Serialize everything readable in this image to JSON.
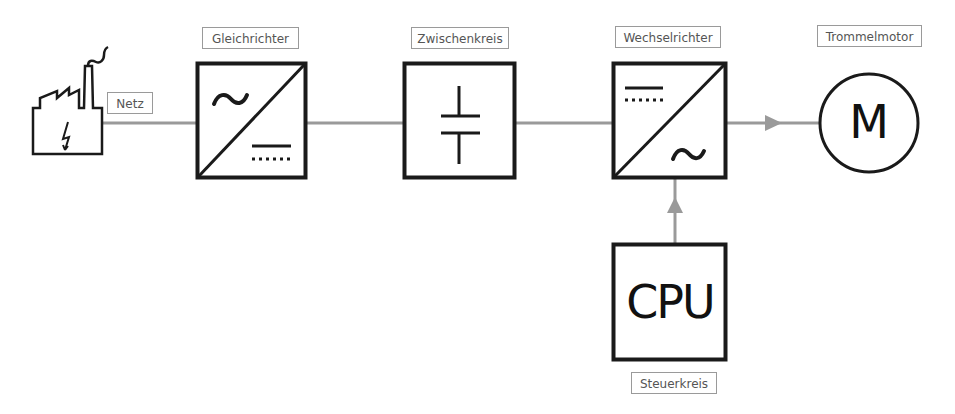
{
  "diagram": {
    "type": "block-diagram",
    "title": "",
    "nodes": [
      {
        "id": "netz",
        "label": "Netz",
        "icon": "factory-power-icon"
      },
      {
        "id": "gleichrichter",
        "label": "Gleichrichter",
        "symbol": "ac-to-dc"
      },
      {
        "id": "zwischenkreis",
        "label": "Zwischenkreis",
        "symbol": "capacitor"
      },
      {
        "id": "wechselrichter",
        "label": "Wechselrichter",
        "symbol": "dc-to-ac"
      },
      {
        "id": "trommelmotor",
        "label": "Trommelmotor",
        "symbol": "motor",
        "symbol_text": "M"
      },
      {
        "id": "steuerkreis",
        "label": "Steuerkreis",
        "symbol_text": "CPU"
      }
    ],
    "edges": [
      {
        "from": "netz",
        "to": "gleichrichter",
        "arrow": false
      },
      {
        "from": "gleichrichter",
        "to": "zwischenkreis",
        "arrow": false
      },
      {
        "from": "zwischenkreis",
        "to": "wechselrichter",
        "arrow": false
      },
      {
        "from": "wechselrichter",
        "to": "trommelmotor",
        "arrow": true
      },
      {
        "from": "steuerkreis",
        "to": "wechselrichter",
        "arrow": true
      }
    ],
    "colors": {
      "line": "#999999",
      "stroke": "#1a1a1a",
      "label_border": "#9a9a9a",
      "label_text": "#555555"
    }
  },
  "labels": {
    "netz": "Netz",
    "gleichrichter": "Gleichrichter",
    "zwischenkreis": "Zwischenkreis",
    "wechselrichter": "Wechselrichter",
    "trommelmotor": "Trommelmotor",
    "steuerkreis": "Steuerkreis"
  },
  "symbols": {
    "motor": "M",
    "cpu": "CPU"
  }
}
